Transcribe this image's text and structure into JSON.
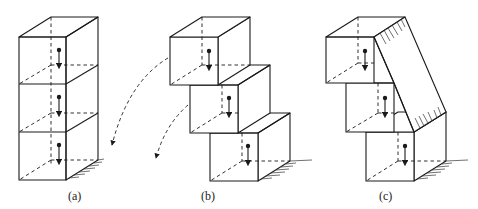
{
  "figure": {
    "panels": [
      {
        "id": "a",
        "label": "(a)",
        "blocks": 3,
        "arrangement": "vertical stack, aligned"
      },
      {
        "id": "b",
        "label": "(b)",
        "blocks": 3,
        "arrangement": "staircase offset, toppling (dashed arc arrows)"
      },
      {
        "id": "c",
        "label": "(c)",
        "blocks": 3,
        "arrangement": "staircase offset, braced by diagonal slab"
      }
    ],
    "colors": {
      "line": "#1a1a1a",
      "background": "#ffffff"
    }
  }
}
